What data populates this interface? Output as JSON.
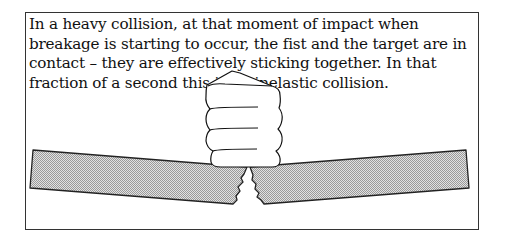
{
  "caption": {
    "text": "In a heavy collision, at that moment of impact when breakage is starting to occur, the fist and the target are in contact – they are effectively sticking together. In that fraction of a second this is an inelastic collision."
  },
  "figure": {
    "elements": [
      "fist",
      "board-left-half",
      "board-right-half",
      "crack"
    ],
    "colors": {
      "outline": "#222222",
      "board_fill": "#cfcfcf",
      "background": "#ffffff"
    }
  }
}
